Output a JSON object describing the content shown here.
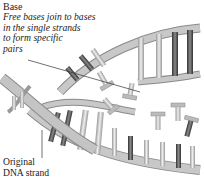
{
  "figure": {
    "colors": {
      "backbone": "#bdbdbd",
      "backbone_edge": "#8a8a8a",
      "base_light": "#e6e6e6",
      "base_mid": "#a8a8a8",
      "base_dark": "#555555",
      "leader_line": "#333333"
    }
  },
  "labels": {
    "base": {
      "title": "Base",
      "description_lines": [
        "Free bases join to bases",
        "in the single strands",
        "to form specific",
        "pairs"
      ]
    },
    "strand": {
      "lines": [
        "Original",
        "DNA strand"
      ]
    }
  }
}
